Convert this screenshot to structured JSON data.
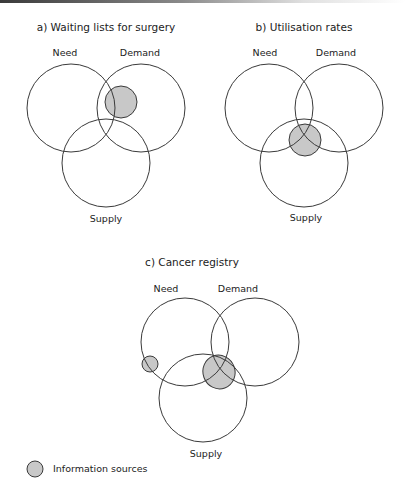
{
  "diagrams": [
    {
      "title": "a) Waiting lists for surgery",
      "labels": {
        "need": "Need",
        "demand": "Demand",
        "supply": "Supply"
      },
      "circles": {
        "need": {
          "cx": 71,
          "cy": 108,
          "r": 44
        },
        "demand": {
          "cx": 141,
          "cy": 108,
          "r": 44
        },
        "supply": {
          "cx": 106,
          "cy": 163,
          "r": 44
        }
      },
      "sources": [
        {
          "cx": 121,
          "cy": 102,
          "r": 16,
          "position": "Need ∩ Demand"
        }
      ]
    },
    {
      "title": "b) Utilisation rates",
      "labels": {
        "need": "Need",
        "demand": "Demand",
        "supply": "Supply"
      },
      "circles": {
        "need": {
          "cx": 269,
          "cy": 108,
          "r": 44
        },
        "demand": {
          "cx": 339,
          "cy": 108,
          "r": 44
        },
        "supply": {
          "cx": 304,
          "cy": 163,
          "r": 44
        }
      },
      "sources": [
        {
          "cx": 305,
          "cy": 140,
          "r": 16,
          "position": "Need ∩ Demand ∩ Supply"
        }
      ]
    },
    {
      "title": "c) Cancer registry",
      "labels": {
        "need": "Need",
        "demand": "Demand",
        "supply": "Supply"
      },
      "circles": {
        "need": {
          "cx": 185,
          "cy": 342,
          "r": 44
        },
        "demand": {
          "cx": 255,
          "cy": 342,
          "r": 44
        },
        "supply": {
          "cx": 203,
          "cy": 398,
          "r": 44
        }
      },
      "sources": [
        {
          "cx": 150,
          "cy": 364,
          "r": 8,
          "position": "Need only"
        },
        {
          "cx": 219,
          "cy": 373,
          "r": 16,
          "position": "Need ∩ Demand ∩ Supply"
        }
      ]
    }
  ],
  "legend": {
    "label": "Information sources",
    "swatch_color": "#c8c8c8"
  },
  "colors": {
    "stroke": "#3a3a3a",
    "fill": "#c8c8c8"
  }
}
